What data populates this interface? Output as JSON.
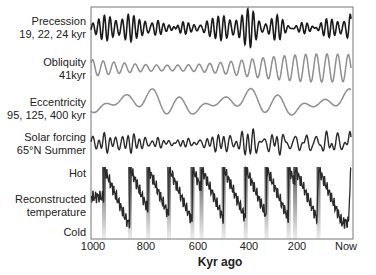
{
  "chart_data": {
    "type": "line",
    "title": "",
    "xlabel": "Kyr ago",
    "ylabel": "",
    "x_range": [
      1000,
      0
    ],
    "x_ticks": [
      "1000",
      "800",
      "600",
      "400",
      "200",
      "Now"
    ],
    "x_tick_values": [
      1000,
      800,
      600,
      400,
      200,
      0
    ],
    "grid": false,
    "legend": "none",
    "panels": [
      {
        "name": "Precession",
        "label_lines": [
          "Precession",
          "19, 22, 24 kyr"
        ],
        "periods_kyr": [
          19,
          22,
          24
        ],
        "color": "#1a1a1a"
      },
      {
        "name": "Obliquity",
        "label_lines": [
          "Obliquity",
          "41kyr"
        ],
        "periods_kyr": [
          41
        ],
        "color": "#8a8a8a"
      },
      {
        "name": "Eccentricity",
        "label_lines": [
          "Eccentricity",
          "95, 125, 400 kyr"
        ],
        "periods_kyr": [
          95,
          125,
          400
        ],
        "color": "#8a8a8a"
      },
      {
        "name": "Solar forcing",
        "label_lines": [
          "Solar forcing",
          "65°N Summer"
        ],
        "periods_kyr": [],
        "color": "#2a2a2a"
      },
      {
        "name": "Reconstructed temperature",
        "label_lines": [
          "Reconstructed",
          "temperature"
        ],
        "y_top_label": "Hot",
        "y_bottom_label": "Cold",
        "color": "#2a2a2a"
      }
    ],
    "interglacial_peaks_kyr_ago": [
      950,
      850,
      780,
      700,
      610,
      575,
      490,
      405,
      325,
      240,
      215,
      125
    ]
  },
  "labels": {
    "precession_1": "Precession",
    "precession_2": "19, 22, 24 kyr",
    "obliquity_1": "Obliquity",
    "obliquity_2": "41kyr",
    "eccentricity_1": "Eccentricity",
    "eccentricity_2": "95, 125, 400 kyr",
    "solar_1": "Solar forcing",
    "solar_2": "65°N Summer",
    "hot": "Hot",
    "temp_1": "Reconstructed",
    "temp_2": "temperature",
    "cold": "Cold"
  },
  "axis": {
    "ticks": [
      "1000",
      "800",
      "600",
      "400",
      "200",
      "Now"
    ],
    "xlabel": "Kyr ago"
  }
}
